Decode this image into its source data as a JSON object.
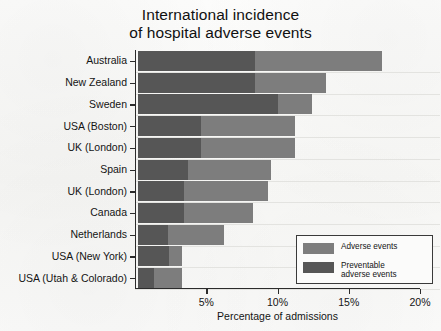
{
  "chart_data": {
    "type": "bar",
    "orientation": "horizontal",
    "title": "International incidence of hospital adverse events",
    "title_lines": [
      "International incidence",
      "of hospital adverse events"
    ],
    "xlabel": "Percentage of admissions",
    "ylabel": "",
    "xlim": [
      0,
      20
    ],
    "xticks": [
      5,
      10,
      15,
      20
    ],
    "xtick_labels": [
      "5%",
      "10%",
      "15%",
      "20%"
    ],
    "grid": true,
    "legend_position": "lower-right",
    "categories": [
      "Australia",
      "New Zealand",
      "Sweden",
      "USA (Boston)",
      "UK (London)",
      "Spain",
      "UK (London)",
      "Canada",
      "Netherlands",
      "USA (New York)",
      "USA (Utah & Colorado)"
    ],
    "series": [
      {
        "name": "Adverse events",
        "color": "#7d7d7d",
        "values": [
          17.1,
          13.2,
          12.2,
          11.0,
          11.0,
          9.3,
          9.1,
          8.1,
          6.0,
          3.1,
          3.1
        ]
      },
      {
        "name": "Preventable adverse events",
        "color": "#565656",
        "values": [
          8.2,
          8.2,
          9.8,
          4.4,
          4.4,
          3.5,
          3.2,
          3.2,
          2.1,
          2.2,
          1.1
        ]
      }
    ]
  },
  "legend": {
    "entries": [
      {
        "label": "Adverse events",
        "color": "#7d7d7d"
      },
      {
        "label": "Preventable\nadverse events",
        "color": "#565656"
      }
    ]
  },
  "colors": {
    "background": "#fbfbfa",
    "axis": "#2b2b2b",
    "grid": "#e3e3e0",
    "text": "#141414",
    "adverse_events": "#7d7d7d",
    "preventable_adverse_events": "#565656"
  }
}
